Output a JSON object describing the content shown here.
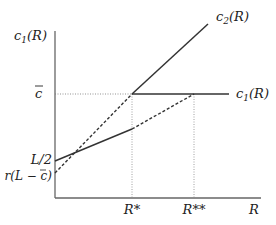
{
  "labels": {
    "y_axis": "c",
    "y_axis_sub": "1",
    "y_axis_arg": "(R)",
    "x_axis": "R",
    "c_bar": "c",
    "L_half": "L/2",
    "r_L_minus_c": "r(L − c)",
    "R_star": "R*",
    "R_double_star": "R**",
    "c2_label": "c",
    "c2_sub": "2",
    "c2_arg": "(R)",
    "c1_label": "c",
    "c1_sub": "1",
    "c1_arg": "(R)"
  },
  "colors": {
    "line": "#333333",
    "axis": "#555555",
    "guide": "#777777"
  }
}
